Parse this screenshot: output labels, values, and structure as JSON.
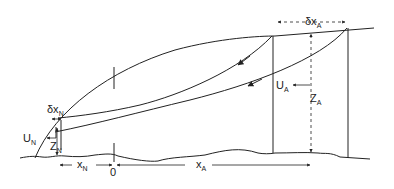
{
  "diagram": {
    "labels": {
      "delta_x_A": {
        "main": "δx",
        "sub": "A"
      },
      "U_A": {
        "main": "U",
        "sub": "A"
      },
      "Z_A": {
        "main": "Z",
        "sub": "A"
      },
      "delta_x_N": {
        "main": "δx",
        "sub": "N"
      },
      "U_N": {
        "main": "U",
        "sub": "N"
      },
      "Z_N": {
        "main": "Z",
        "sub": "N"
      },
      "x_N": {
        "main": "x",
        "sub": "N"
      },
      "x_A": {
        "main": "x",
        "sub": "A"
      },
      "origin": "0"
    },
    "stroke_color": "#222222"
  }
}
